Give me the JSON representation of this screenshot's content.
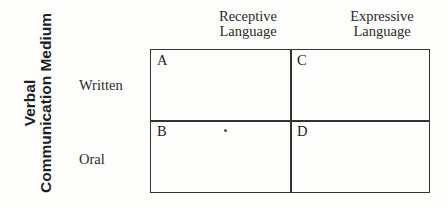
{
  "diagram": {
    "y_axis_title": [
      "Verbal",
      "Communication Medium"
    ],
    "columns": [
      {
        "label_lines": [
          "Receptive",
          "Language"
        ]
      },
      {
        "label_lines": [
          "Expressive",
          "Language"
        ]
      }
    ],
    "rows": [
      {
        "label": "Written"
      },
      {
        "label": "Oral"
      }
    ],
    "cells": [
      {
        "id": "A",
        "row": "Written",
        "column": "Receptive Language"
      },
      {
        "id": "C",
        "row": "Written",
        "column": "Expressive Language"
      },
      {
        "id": "B",
        "row": "Oral",
        "column": "Receptive Language"
      },
      {
        "id": "D",
        "row": "Oral",
        "column": "Expressive Language"
      }
    ]
  }
}
